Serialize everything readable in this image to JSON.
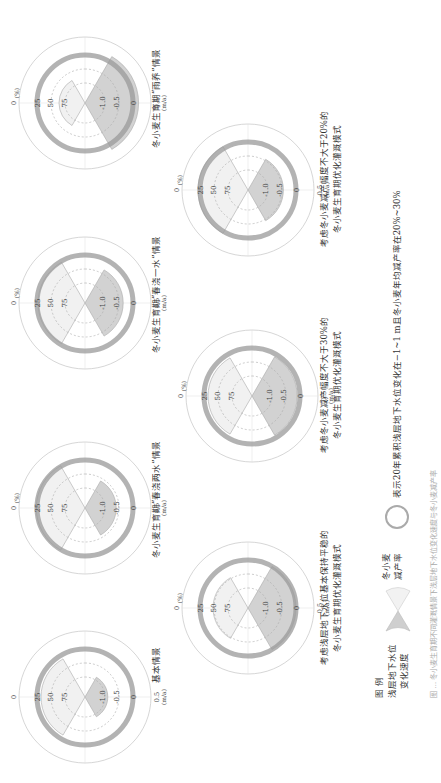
{
  "figure": {
    "axis_labels": {
      "rate_top": "0.5",
      "rate_unit": "(m/a)",
      "pct_top": "0",
      "pct_unit": "(%)",
      "ring_ticks": [
        "25",
        "50",
        "75"
      ],
      "rate_ticks": [
        "0",
        "-0.5",
        "-1.0"
      ]
    },
    "gauges": [
      {
        "title": "基本情景",
        "yield_pct": 30,
        "gw_rate": -0.9,
        "has_pct_unit": false
      },
      {
        "title": "冬小麦生育期“春浇两水”情景",
        "yield_pct": 22,
        "gw_rate": -0.6,
        "has_pct_unit": true
      },
      {
        "title": "冬小麦生育期“春浇一水”情景",
        "yield_pct": 25,
        "gw_rate": -0.35,
        "has_pct_unit": true
      },
      {
        "title": "冬小麦生育期“雨养”情景",
        "yield_pct": 60,
        "gw_rate": 0.2,
        "has_pct_unit": true
      },
      {
        "title_lines": [
          "考虑浅层地下水位基本保持平稳的",
          "冬小麦生育期优化灌溉模式"
        ],
        "yield_pct": 45,
        "gw_rate": 0.0
      },
      {
        "title_lines": [
          "考虑冬小麦减产幅度不大于30%的",
          "冬小麦生育期优化灌溉模式"
        ],
        "yield_pct": 30,
        "gw_rate": -0.1
      },
      {
        "title_lines": [
          "考虑冬小麦减产幅度不大于20%的",
          "冬小麦生育期优化灌溉模式"
        ],
        "yield_pct": 20,
        "gw_rate": -0.45
      }
    ]
  },
  "legend": {
    "title": "图  例",
    "gw_label_lines": [
      "浅层地下水位",
      "变化速度"
    ],
    "yield_label_lines": [
      "冬小麦",
      "减产率"
    ],
    "ring_desc": "表示20年累积浅层地下水位变化在−1~1 m且冬小麦年均减产率在20%~30%"
  },
  "caption": "图 … 冬小麦生育期不同灌溉情景下浅层地下水位变化速度与冬小麦减产率"
}
